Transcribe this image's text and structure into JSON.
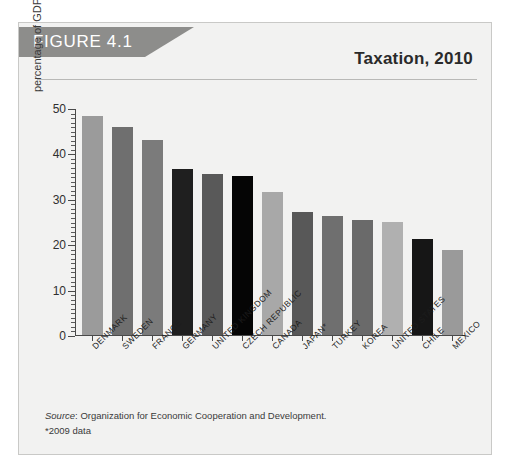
{
  "figure": {
    "banner_label": "FIGURE 4.1",
    "title": "Taxation, 2010",
    "source_word": "Source",
    "source_text": ": Organization for Economic Cooperation and Development.",
    "footnote": "*2009 data"
  },
  "colors": {
    "panel_background": "#f2f2f1",
    "panel_border": "#c9c9c7",
    "banner": "#8d8d8b",
    "banner_text": "#ffffff",
    "title_text": "#2a2a2a",
    "axis": "#4a4a4a",
    "rule": "#b9b9b7"
  },
  "chart_data": {
    "type": "bar",
    "title": "Taxation, 2010",
    "xlabel": "",
    "ylabel": "percentage of GDP",
    "ylim": [
      0,
      50
    ],
    "yticks": [
      0,
      10,
      20,
      30,
      40,
      50
    ],
    "ytick_labels": [
      "0",
      "10",
      "20",
      "30",
      "40",
      "50"
    ],
    "minor_tick_step": 1,
    "grid": false,
    "legend": null,
    "categories": [
      "DENMARK",
      "SWEDEN",
      "FRANCE",
      "GERMANY",
      "UNITED KINGDOM",
      "CZECH REPUBLIC",
      "CANADA",
      "JAPAN*",
      "TURKEY",
      "KOREA",
      "UNITED STATES",
      "CHILE",
      "MEXICO"
    ],
    "values": [
      48.3,
      45.8,
      42.9,
      36.5,
      35.4,
      35.1,
      31.4,
      27.2,
      26.3,
      25.4,
      24.9,
      21.2,
      18.7
    ],
    "bar_colors": [
      "#9b9b9b",
      "#6f6f6f",
      "#7b7b7b",
      "#1f1f1f",
      "#595959",
      "#050505",
      "#a8a8a8",
      "#585858",
      "#6f6f6f",
      "#6a6a6a",
      "#b0b0b0",
      "#161616",
      "#9a9a9a"
    ],
    "annotations": [
      "*2009 data"
    ],
    "source": "Organization for Economic Cooperation and Development."
  }
}
